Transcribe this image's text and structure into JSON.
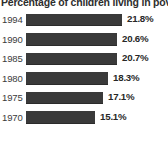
{
  "chart_data": {
    "type": "bar",
    "orientation": "horizontal",
    "title": "Percentage of children living in poverty",
    "xlabel": "",
    "ylabel": "",
    "categories": [
      "1994",
      "1990",
      "1985",
      "1980",
      "1975",
      "1970"
    ],
    "values": [
      21.8,
      20.6,
      20.7,
      18.3,
      17.1,
      15.1
    ],
    "value_labels": [
      "21.8%",
      "20.6%",
      "20.7%",
      "18.3%",
      "17.1%",
      "15.1%"
    ],
    "xlim": [
      0,
      24
    ],
    "grid": false,
    "legend": null,
    "bar_color": "#3a3a3a",
    "background_color": "#ffffff",
    "text_color": "#2e2e2e",
    "rows": [
      {
        "category": "1994",
        "value": 21.8,
        "value_label": "21.8%",
        "bar_width_px": 96
      },
      {
        "category": "1990",
        "value": 20.6,
        "value_label": "20.6%",
        "bar_width_px": 91
      },
      {
        "category": "1985",
        "value": 20.7,
        "value_label": "20.7%",
        "bar_width_px": 91
      },
      {
        "category": "1980",
        "value": 18.3,
        "value_label": "18.3%",
        "bar_width_px": 82
      },
      {
        "category": "1975",
        "value": 17.1,
        "value_label": "17.1%",
        "bar_width_px": 77
      },
      {
        "category": "1970",
        "value": 15.1,
        "value_label": "15.1%",
        "bar_width_px": 69
      }
    ]
  }
}
